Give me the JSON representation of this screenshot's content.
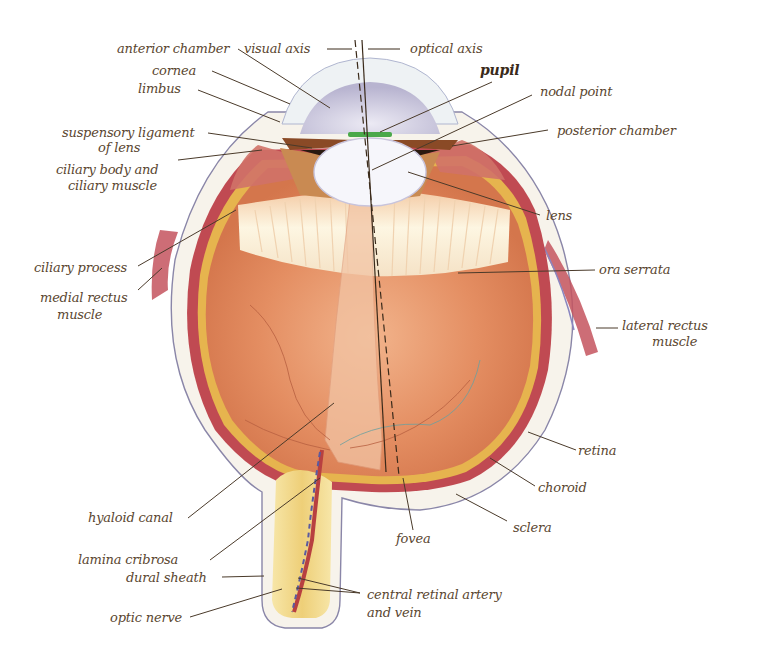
{
  "diagram": {
    "colors": {
      "background": "#ffffff",
      "label_text": "#5a4630",
      "leader_line": "#4a3a2a",
      "sclera": "#f6f2ea",
      "sclera_outline": "#8a86a8",
      "choroid": "#b8404a",
      "retina": "#e2b14a",
      "vitreous": "#e08a5e",
      "vitreous_light": "#f0b08a",
      "ciliary_zonule": "#fbf1d8",
      "lens": "#f4f4fa",
      "cornea": "#c8c6dc",
      "iris": "#a0562c",
      "pupil_green": "#4aa84a",
      "rectus_muscle": "#c4545e",
      "optic_nerve": "#f0d890",
      "central_artery": "#b84040",
      "central_vein": "#5a5aa0"
    },
    "labels": [
      {
        "id": "anterior-chamber",
        "text": "anterior chamber"
      },
      {
        "id": "visual-axis",
        "text": "visual axis"
      },
      {
        "id": "optical-axis",
        "text": "optical axis"
      },
      {
        "id": "cornea",
        "text": "cornea"
      },
      {
        "id": "limbus",
        "text": "limbus"
      },
      {
        "id": "pupil",
        "text": "pupil"
      },
      {
        "id": "nodal-point",
        "text": "nodal point"
      },
      {
        "id": "posterior-chamber",
        "text": "posterior chamber"
      },
      {
        "id": "suspensory-ligament-1",
        "text": "suspensory ligament"
      },
      {
        "id": "suspensory-ligament-2",
        "text": "of lens"
      },
      {
        "id": "ciliary-body-1",
        "text": "ciliary body and"
      },
      {
        "id": "ciliary-body-2",
        "text": "ciliary muscle"
      },
      {
        "id": "lens",
        "text": "lens"
      },
      {
        "id": "ciliary-process",
        "text": "ciliary process"
      },
      {
        "id": "ora-serrata",
        "text": "ora serrata"
      },
      {
        "id": "medial-rectus-1",
        "text": "medial rectus"
      },
      {
        "id": "medial-rectus-2",
        "text": "muscle"
      },
      {
        "id": "lateral-rectus-1",
        "text": "lateral rectus"
      },
      {
        "id": "lateral-rectus-2",
        "text": "muscle"
      },
      {
        "id": "retina",
        "text": "retina"
      },
      {
        "id": "choroid",
        "text": "choroid"
      },
      {
        "id": "hyaloid-canal",
        "text": "hyaloid canal"
      },
      {
        "id": "fovea",
        "text": "fovea"
      },
      {
        "id": "sclera",
        "text": "sclera"
      },
      {
        "id": "lamina-cribrosa",
        "text": "lamina cribrosa"
      },
      {
        "id": "dural-sheath",
        "text": "dural sheath"
      },
      {
        "id": "central-retinal-1",
        "text": "central retinal artery"
      },
      {
        "id": "central-retinal-2",
        "text": "and vein"
      },
      {
        "id": "optic-nerve",
        "text": "optic nerve"
      }
    ]
  }
}
